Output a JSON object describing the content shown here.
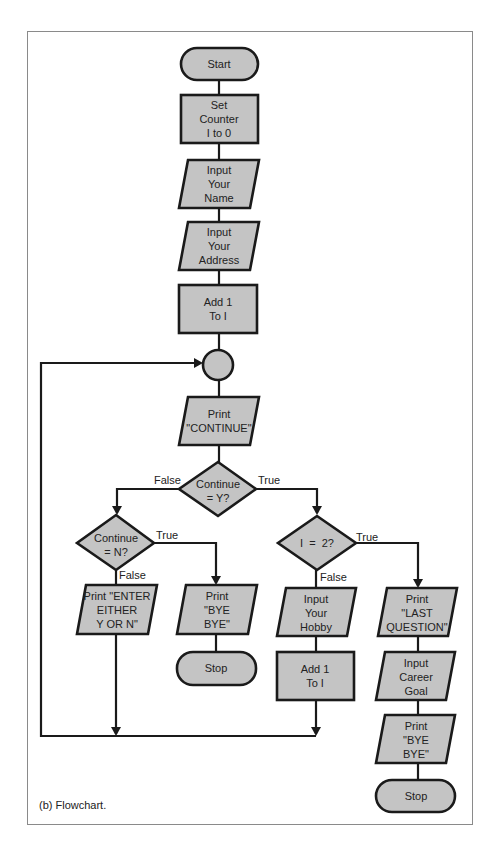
{
  "caption": "(b) Flowchart.",
  "colors": {
    "shape_fill": "#c4c4c4",
    "stroke": "#1a1a1a",
    "background": "#ffffff",
    "frame": "#8a8a8a"
  },
  "nodes": {
    "start": {
      "type": "terminator",
      "lines": [
        "Start"
      ]
    },
    "set_counter": {
      "type": "process",
      "lines": [
        "Set",
        "Counter",
        "I to 0"
      ]
    },
    "input_name": {
      "type": "io",
      "lines": [
        "Input",
        "Your",
        "Name"
      ]
    },
    "input_address": {
      "type": "io",
      "lines": [
        "Input",
        "Your",
        "Address"
      ]
    },
    "add1_a": {
      "type": "process",
      "lines": [
        "Add 1",
        "To I"
      ]
    },
    "connector": {
      "type": "connector",
      "lines": []
    },
    "print_continue": {
      "type": "io",
      "lines": [
        "Print",
        "\"CONTINUE\""
      ]
    },
    "dec_continue_y": {
      "type": "decision",
      "lines": [
        "Continue",
        "= Y?"
      ]
    },
    "dec_continue_n": {
      "type": "decision",
      "lines": [
        "Continue",
        "= N?"
      ]
    },
    "print_enter": {
      "type": "io",
      "lines": [
        "Print \"ENTER",
        "EITHER",
        "Y OR N\""
      ]
    },
    "print_bye_a": {
      "type": "io",
      "lines": [
        "Print",
        "\"BYE",
        "BYE\""
      ]
    },
    "stop_a": {
      "type": "terminator",
      "lines": [
        "Stop"
      ]
    },
    "dec_i2": {
      "type": "decision",
      "lines": [
        "I  =  2?"
      ]
    },
    "input_hobby": {
      "type": "io",
      "lines": [
        "Input",
        "Your",
        "Hobby"
      ]
    },
    "add1_b": {
      "type": "process",
      "lines": [
        "Add 1",
        "To I"
      ]
    },
    "print_last": {
      "type": "io",
      "lines": [
        "Print",
        "\"LAST",
        "QUESTION\""
      ]
    },
    "input_career": {
      "type": "io",
      "lines": [
        "Input",
        "Career",
        "Goal"
      ]
    },
    "print_bye_b": {
      "type": "io",
      "lines": [
        "Print",
        "\"BYE",
        "BYE\""
      ]
    },
    "stop_b": {
      "type": "terminator",
      "lines": [
        "Stop"
      ]
    }
  },
  "edge_labels": {
    "y_false": "False",
    "y_true": "True",
    "n_true": "True",
    "n_false": "False",
    "i2_true": "True",
    "i2_false": "False"
  }
}
